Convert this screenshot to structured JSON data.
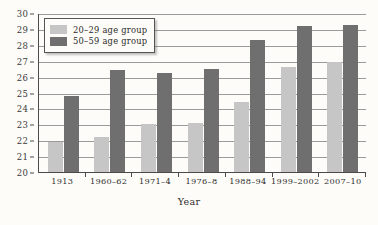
{
  "chart_data": {
    "type": "bar",
    "title": "",
    "xlabel": "Year",
    "ylabel": "",
    "ylim": [
      20,
      30
    ],
    "ytick_step": 1,
    "yticks": [
      "30",
      "29",
      "28",
      "27",
      "26",
      "25",
      "24",
      "23",
      "22",
      "21",
      "20"
    ],
    "grid": true,
    "legend_position": "top-left",
    "categories": [
      "1913",
      "1960–62",
      "1971–4",
      "1976–8",
      "1988–94",
      "1999–2002",
      "2007–10"
    ],
    "series": [
      {
        "name": "20–29 age group",
        "color": "#c6c6c6",
        "values": [
          21.9,
          22.2,
          23.0,
          23.1,
          24.4,
          26.6,
          26.9
        ]
      },
      {
        "name": "50–59 age group",
        "color": "#6f6f6f",
        "values": [
          24.8,
          26.4,
          26.2,
          26.5,
          28.3,
          29.2,
          29.25
        ]
      }
    ]
  },
  "legend": {
    "items": [
      {
        "label": "20–29 age group",
        "swatch": "light"
      },
      {
        "label": "50–59 age group",
        "swatch": "dark"
      }
    ]
  },
  "colors": {
    "background": "#fdfcf8",
    "axis": "#4a4a4a",
    "gridline": "#9a9a9a",
    "series_light": "#c6c6c6",
    "series_dark": "#6f6f6f"
  }
}
